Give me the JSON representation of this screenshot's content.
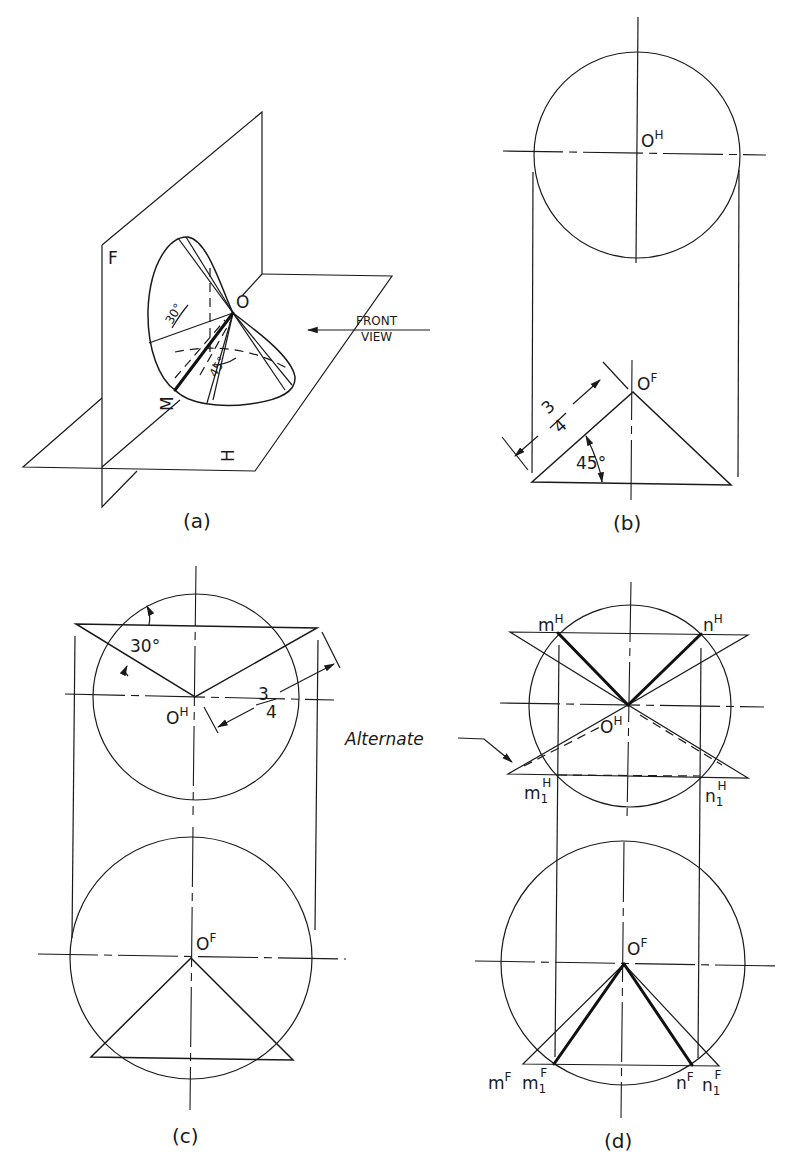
{
  "figure": {
    "panels": [
      {
        "id": "a",
        "caption": "(a)",
        "plane_labels": {
          "frontal": "F",
          "horizontal": "H"
        },
        "point_labels": {
          "vertex": "O",
          "point_m": "M"
        },
        "angle_labels": {
          "upper": "30°",
          "lower": "45°"
        },
        "view_arrow": {
          "line1": "FRONT",
          "line2": "VIEW"
        }
      },
      {
        "id": "b",
        "caption": "(b)",
        "top_view_label": {
          "base": "O",
          "sup": "H"
        },
        "front_view_label": {
          "base": "O",
          "sup": "F"
        },
        "dimension": {
          "numerator": "3",
          "denominator": "4"
        },
        "angle": "45°"
      },
      {
        "id": "c",
        "caption": "(c)",
        "top_view_label": {
          "base": "O",
          "sup": "H"
        },
        "front_view_label": {
          "base": "O",
          "sup": "F"
        },
        "dimension": {
          "numerator": "3",
          "denominator": "4"
        },
        "angle": "30°"
      },
      {
        "id": "d",
        "caption": "(d)",
        "top_view_label": {
          "base": "O",
          "sup": "H"
        },
        "front_view_label": {
          "base": "O",
          "sup": "F"
        },
        "annotation": "Alternate",
        "top_points": {
          "m": {
            "base": "m",
            "sup": "H"
          },
          "n": {
            "base": "n",
            "sup": "H"
          },
          "m1": {
            "base": "m",
            "sub": "1",
            "sup": "H"
          },
          "n1": {
            "base": "n",
            "sub": "1",
            "sup": "H"
          }
        },
        "front_points": {
          "m": {
            "base": "m",
            "sup": "F"
          },
          "m1": {
            "base": "m",
            "sub": "1",
            "sup": "F"
          },
          "n": {
            "base": "n",
            "sup": "F"
          },
          "n1": {
            "base": "n",
            "sub": "1",
            "sup": "F"
          }
        }
      }
    ]
  }
}
